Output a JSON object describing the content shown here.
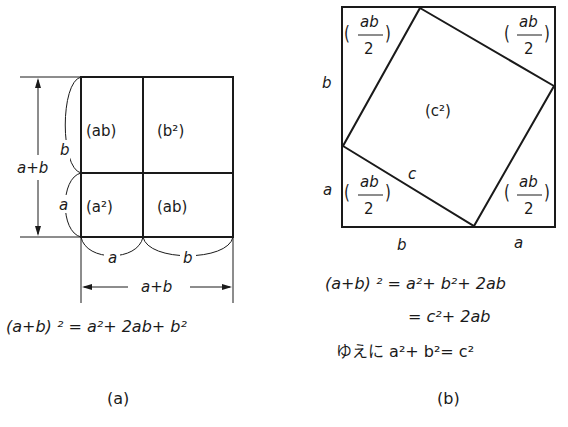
{
  "figure_a": {
    "caption": "(a)",
    "cells": {
      "top_left": "(ab)",
      "top_right": "(b²)",
      "bottom_left": "(a²)",
      "bottom_right": "(ab)"
    },
    "side_labels": {
      "left_upper": "b",
      "left_lower": "a",
      "left_total": "a+b",
      "bottom_left": "a",
      "bottom_right": "b",
      "bottom_total": "a+b"
    },
    "equation": "(a+b) ² = a²+ 2ab+ b²"
  },
  "figure_b": {
    "caption": "(b)",
    "corner_labels": {
      "top_left": {
        "num": "ab",
        "den": "2"
      },
      "top_right": {
        "num": "ab",
        "den": "2"
      },
      "bottom_left": {
        "num": "ab",
        "den": "2"
      },
      "bottom_right": {
        "num": "ab",
        "den": "2"
      }
    },
    "center_label": "(c²)",
    "hypotenuse_label": "c",
    "side_labels": {
      "left_upper": "b",
      "left_lower": "a",
      "bottom_left": "b",
      "bottom_right": "a"
    },
    "equations": [
      "(a+b) ² = a²+ b²+ 2ab",
      "= c²+ 2ab",
      "ゆえに  a²+ b²= c²"
    ]
  }
}
